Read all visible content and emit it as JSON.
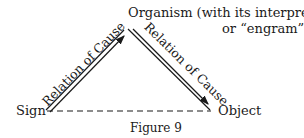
{
  "nodes": {
    "organism_line1": "Organism (with its interpretant",
    "organism_line2": "or “engram”)",
    "sign": "Sign",
    "object": "Object"
  },
  "edges": {
    "sign_to_organism": "Relation of Cause",
    "organism_to_object": "Relation of Cause",
    "sign_object": ""
  },
  "caption": "Figure 9",
  "colors": {
    "ink": "#1a1a1a",
    "background": "#ffffff"
  }
}
